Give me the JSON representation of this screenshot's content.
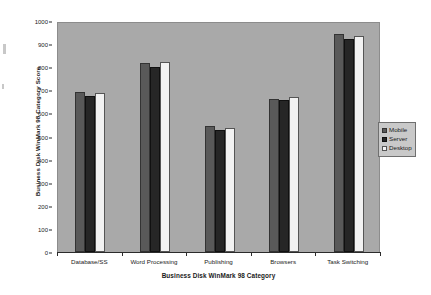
{
  "chart_data": {
    "type": "bar",
    "title": "",
    "xlabel": "Business Disk WinMark 98 Category",
    "ylabel": "Business Disk WinMark 98 Category Score",
    "categories": [
      "Database/SS",
      "Word Processing",
      "Publishing",
      "Browsers",
      "Task Switching"
    ],
    "series": [
      {
        "name": "Mobile",
        "color": "#595959",
        "values": [
          693,
          820,
          545,
          663,
          943
        ]
      },
      {
        "name": "Server",
        "color": "#262626",
        "values": [
          675,
          799,
          530,
          658,
          923
        ]
      },
      {
        "name": "Desktop",
        "color": "#f2f2f2",
        "values": [
          690,
          823,
          538,
          670,
          937
        ]
      }
    ],
    "ylim": [
      0,
      1000
    ],
    "ytick_values": [
      0,
      100,
      200,
      300,
      400,
      500,
      600,
      700,
      800,
      900,
      1000
    ],
    "ytick_labels": [
      "0",
      "100",
      "200",
      "300",
      "400",
      "500",
      "600",
      "700",
      "800",
      "900",
      "1000"
    ],
    "grid": false,
    "legend_position": "right",
    "plot_background_color": "#a9a9a9",
    "figure_background_color": "#ffffff"
  },
  "legend": {
    "entries": [
      {
        "label": "Mobile"
      },
      {
        "label": "Server"
      },
      {
        "label": "Desktop"
      }
    ]
  }
}
